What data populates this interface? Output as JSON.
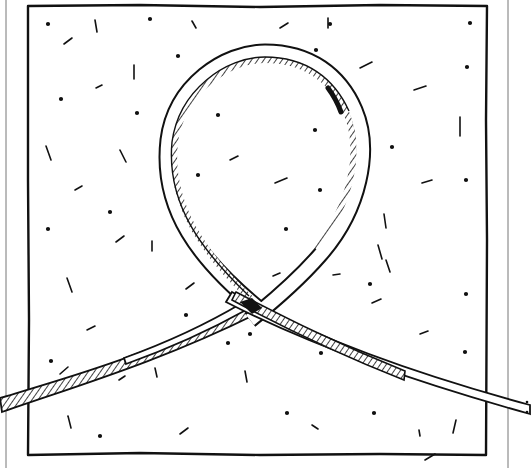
{
  "illustration": {
    "subject": "ribbon loop on speckled square",
    "description": "Hand-drawn line illustration of a twisted ribbon forming a loop that crosses itself, lying on a square panel with scattered dots and dashes",
    "colors": {
      "ink": "#111111",
      "paper": "#ffffff",
      "frame_line": "#777777"
    }
  }
}
